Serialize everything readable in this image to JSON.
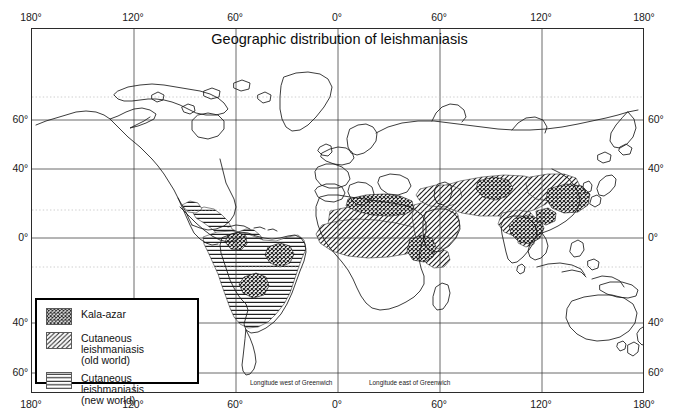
{
  "figure": {
    "title": "Geographic distribution of leishmaniasis",
    "projection_note_west": "Longitude west of Greenwich",
    "projection_note_east": "Longitude east of Greenwich"
  },
  "axes": {
    "longitude_top": [
      {
        "label": "180°",
        "value": -180
      },
      {
        "label": "120°",
        "value": -120
      },
      {
        "label": "60°",
        "value": -60
      },
      {
        "label": "0°",
        "value": 0
      },
      {
        "label": "60°",
        "value": 60
      },
      {
        "label": "120°",
        "value": 120
      },
      {
        "label": "180°",
        "value": 180
      }
    ],
    "longitude_bottom": [
      {
        "label": "180°",
        "value": -180
      },
      {
        "label": "120°",
        "value": -120
      },
      {
        "label": "60°",
        "value": -60
      },
      {
        "label": "0°",
        "value": 0
      },
      {
        "label": "60°",
        "value": 60
      },
      {
        "label": "120°",
        "value": 120
      },
      {
        "label": "180°",
        "value": 180
      }
    ],
    "latitude_left": [
      {
        "label": "60°",
        "value": 60
      },
      {
        "label": "40°",
        "value": 40
      },
      {
        "label": "0°",
        "value": 0
      },
      {
        "label": "40°",
        "value": -40
      },
      {
        "label": "60°",
        "value": -60
      }
    ],
    "latitude_right": [
      {
        "label": "60°",
        "value": 60
      },
      {
        "label": "40°",
        "value": 40
      },
      {
        "label": "0°",
        "value": 0
      },
      {
        "label": "40°",
        "value": -40
      },
      {
        "label": "60°",
        "value": -60
      }
    ]
  },
  "legend": {
    "items": [
      {
        "label": "Kala-azar",
        "sublabel": "",
        "pattern": "cross-hatch"
      },
      {
        "label": "Cutaneous leishmaniasis",
        "sublabel": "(old world)",
        "pattern": "diagonal-hatch"
      },
      {
        "label": "Cutaneous leishmaniasis",
        "sublabel": "(new world)",
        "pattern": "horizontal-hatch"
      }
    ]
  },
  "colors": {
    "frame": "#2b2b2b",
    "gridline": "#3a3a3a",
    "dotted_gridline": "#b0b0b0",
    "coastline": "#1a1a1a",
    "hatch": "#202020",
    "legend_border": "#000000",
    "background": "#ffffff"
  }
}
